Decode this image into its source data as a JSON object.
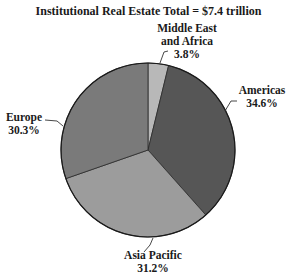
{
  "chart_data": {
    "type": "pie",
    "title": "Institutional Real Estate Total = $7.4 trillion",
    "start_angle_deg": 0,
    "direction": "clockwise",
    "slices": [
      {
        "label": "Middle East and Africa",
        "label_lines": [
          "Middle East",
          "and Africa"
        ],
        "value": 3.8,
        "display": "3.8%",
        "color": "#b8b8b8"
      },
      {
        "label": "Americas",
        "label_lines": [
          "Americas"
        ],
        "value": 34.6,
        "display": "34.6%",
        "color": "#565656"
      },
      {
        "label": "Asia Pacific",
        "label_lines": [
          "Asia Pacific"
        ],
        "value": 31.2,
        "display": "31.2%",
        "color": "#9c9c9c"
      },
      {
        "label": "Europe",
        "label_lines": [
          "Europe"
        ],
        "value": 30.3,
        "display": "30.3%",
        "color": "#7a7a7a"
      }
    ],
    "unit": "%",
    "total": "$7.4 trillion",
    "legend": "none (direct labels with leader lines)"
  },
  "labels": {
    "mea": {
      "line1": "Middle East",
      "line2": "and Africa",
      "pct": "3.8%"
    },
    "americas": {
      "line1": "Americas",
      "pct": "34.6%"
    },
    "europe": {
      "line1": "Europe",
      "pct": "30.3%"
    },
    "asia": {
      "line1": "Asia Pacific",
      "pct": "31.2%"
    }
  }
}
